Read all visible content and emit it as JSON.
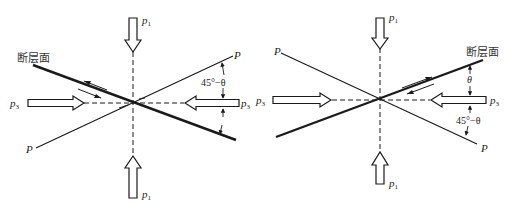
{
  "diagrams": [
    {
      "id": "left",
      "fault_label": "断层面",
      "stress_max_label": "p",
      "stress_max_sub": "1",
      "stress_min_label": "p",
      "stress_min_sub": "3",
      "plane_label_top": "P",
      "plane_label_bottom": "P",
      "angle_label": "45°−θ"
    },
    {
      "id": "right",
      "fault_label": "断层面",
      "stress_max_label": "p",
      "stress_max_sub": "1",
      "stress_min_label": "p",
      "stress_min_sub": "3",
      "plane_label_top": "P",
      "plane_label_bottom": "P",
      "angle_theta_label": "θ",
      "angle_label": "45°−θ"
    }
  ],
  "colors": {
    "line": "#1a1a1a",
    "arrow_fill": "#ffffff",
    "background": "#ffffff"
  }
}
